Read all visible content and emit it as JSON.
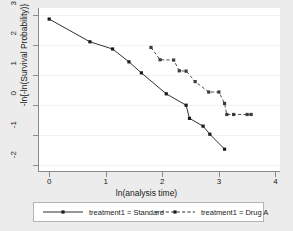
{
  "chart_data": {
    "type": "line",
    "title": "",
    "xlabel": "ln(analysis time)",
    "ylabel": "-ln{-ln(Survival Probability)}",
    "xlim": [
      -0.18,
      4.08
    ],
    "ylim": [
      -2.2,
      3.25
    ],
    "xticks": [
      0,
      1,
      2,
      3,
      4
    ],
    "yticks": [
      3,
      2,
      1,
      0,
      -1,
      -2
    ],
    "xtick_labels": [
      "0",
      "1",
      "2",
      "3",
      "4"
    ],
    "ytick_labels": [
      "3",
      "2",
      "1",
      "0",
      "-1",
      "-2"
    ],
    "grid": "horizontal",
    "legend_position": "below",
    "series": [
      {
        "name": "treatment1 = Standard",
        "style": "solid",
        "marker": "square",
        "color": "#1a1a1a",
        "points": [
          [
            0.0,
            2.88
          ],
          [
            0.72,
            2.12
          ],
          [
            1.12,
            1.88
          ],
          [
            1.41,
            1.45
          ],
          [
            1.63,
            1.08
          ],
          [
            2.07,
            0.38
          ],
          [
            2.42,
            0.0
          ],
          [
            2.48,
            -0.44
          ],
          [
            2.72,
            -0.7
          ],
          [
            2.84,
            -0.97
          ],
          [
            3.1,
            -1.47
          ]
        ]
      },
      {
        "name": "treatment1 = Drug A",
        "style": "dashed",
        "marker": "square",
        "color": "#3b3b3b",
        "points": [
          [
            1.8,
            1.93
          ],
          [
            1.96,
            1.52
          ],
          [
            2.2,
            1.51
          ],
          [
            2.3,
            1.15
          ],
          [
            2.42,
            1.14
          ],
          [
            2.58,
            0.79
          ],
          [
            2.82,
            0.44
          ],
          [
            3.0,
            0.44
          ],
          [
            3.1,
            0.06
          ],
          [
            3.14,
            -0.31
          ],
          [
            3.26,
            -0.31
          ],
          [
            3.5,
            -0.31
          ],
          [
            3.57,
            -0.31
          ]
        ]
      }
    ]
  },
  "legend": {
    "items": [
      {
        "label": "treatment1 = Standard",
        "style": "solid"
      },
      {
        "label": "treatment1 = Drug A",
        "style": "dashed"
      }
    ]
  }
}
